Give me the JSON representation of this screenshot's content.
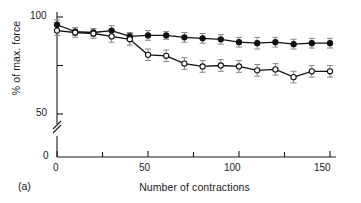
{
  "panel": {
    "label": "(a)"
  },
  "chart_data": {
    "type": "line",
    "title": "",
    "subtitle": "",
    "xlabel": "Number of contractions",
    "ylabel": "% of max. force",
    "xlim": [
      0,
      150
    ],
    "ylim": [
      0,
      100
    ],
    "y_axis_break": true,
    "y_break_between": [
      5,
      48
    ],
    "grid": false,
    "legend_position": "none",
    "x_ticks": [
      0,
      50,
      100,
      150
    ],
    "x_minor_ticks": [
      25,
      75,
      125
    ],
    "x_tick_labels": [
      "0",
      "50",
      "100",
      "150"
    ],
    "y_ticks": [
      0,
      50,
      100
    ],
    "y_minor_ticks": [
      75
    ],
    "y_tick_labels": [
      "0",
      "50",
      "100"
    ],
    "x": [
      0,
      10,
      20,
      30,
      40,
      50,
      60,
      70,
      80,
      90,
      100,
      110,
      120,
      130,
      140,
      150
    ],
    "series": [
      {
        "name": "filled-circles",
        "marker": "filled-circle",
        "color": "#111111",
        "values": [
          96.0,
          92.5,
          92.0,
          93.0,
          90.0,
          90.5,
          90.5,
          89.5,
          89.0,
          88.5,
          87.0,
          86.5,
          87.0,
          86.0,
          86.5,
          86.5
        ],
        "errors": [
          2.5,
          2.0,
          2.0,
          2.5,
          2.0,
          2.5,
          2.0,
          2.5,
          2.5,
          2.5,
          2.5,
          3.0,
          2.5,
          2.5,
          2.5,
          2.5
        ]
      },
      {
        "name": "open-circles",
        "marker": "open-circle",
        "color": "#111111",
        "values": [
          93.0,
          92.0,
          91.5,
          90.0,
          88.5,
          80.5,
          80.0,
          76.0,
          74.5,
          75.0,
          74.5,
          72.5,
          73.0,
          69.0,
          72.0,
          72.0
        ],
        "errors": [
          2.5,
          2.5,
          2.5,
          3.0,
          3.0,
          3.0,
          3.0,
          3.0,
          3.0,
          3.0,
          3.0,
          3.0,
          3.0,
          3.0,
          3.0,
          3.0
        ]
      }
    ]
  },
  "colors": {
    "axis": "#1a1a1a",
    "marker_fill": "#111111",
    "marker_open_fill": "#ffffff",
    "error_bar": "#888888",
    "background": "#ffffff"
  }
}
